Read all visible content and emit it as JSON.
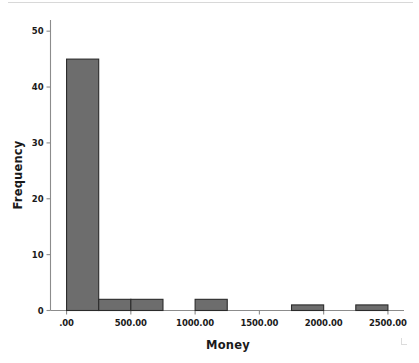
{
  "chart_data": {
    "type": "bar",
    "title": "",
    "subtitle": "",
    "xlabel": "Money",
    "ylabel": "Frequency",
    "grid": false,
    "legend": false,
    "legend_position": "none",
    "bar_color": "#6d6d6d",
    "bar_edge_color": "#2b2b2b",
    "axis_color": "#8c8c8c",
    "background_color": "#ffffff",
    "bin_width": 250,
    "xlim": [
      -125,
      2625
    ],
    "ylim": [
      0,
      52
    ],
    "x_ticks": [
      0,
      500,
      1000,
      1500,
      2000,
      2500
    ],
    "x_tick_labels": [
      ".00",
      "500.00",
      "1000.00",
      "1500.00",
      "2000.00",
      "2500.00"
    ],
    "y_ticks": [
      0,
      10,
      20,
      30,
      40,
      50
    ],
    "y_tick_labels": [
      "0",
      "10",
      "20",
      "30",
      "40",
      "50"
    ],
    "bins": [
      {
        "start": 0,
        "end": 250,
        "value": 45
      },
      {
        "start": 250,
        "end": 500,
        "value": 2
      },
      {
        "start": 500,
        "end": 750,
        "value": 2
      },
      {
        "start": 750,
        "end": 1000,
        "value": 0
      },
      {
        "start": 1000,
        "end": 1250,
        "value": 2
      },
      {
        "start": 1250,
        "end": 1500,
        "value": 0
      },
      {
        "start": 1500,
        "end": 1750,
        "value": 0
      },
      {
        "start": 1750,
        "end": 2000,
        "value": 1
      },
      {
        "start": 2000,
        "end": 2250,
        "value": 0
      },
      {
        "start": 2250,
        "end": 2500,
        "value": 1
      }
    ],
    "categories": [
      "0-250",
      "250-500",
      "500-750",
      "750-1000",
      "1000-1250",
      "1250-1500",
      "1500-1750",
      "1750-2000",
      "2000-2250",
      "2250-2500"
    ],
    "values": [
      45,
      2,
      2,
      0,
      2,
      0,
      0,
      1,
      0,
      1
    ]
  }
}
